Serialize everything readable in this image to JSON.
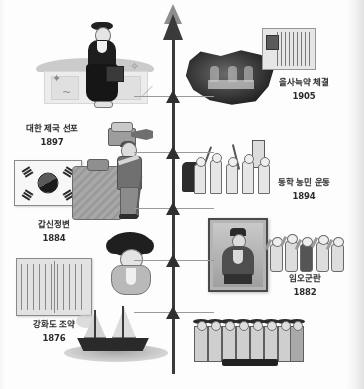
{
  "document": {
    "type": "korean-history-timeline-infographic",
    "orientation": "vertical-ascending-arrow",
    "colors": {
      "ink": "#2b2b2b",
      "timeline": "#3a3a3a",
      "page": "#fdfdfd"
    }
  },
  "timeline": {
    "name": "history-timeline-arrow",
    "direction": "upward",
    "nodes": [
      {
        "index": 0,
        "top_pct": 93
      },
      {
        "index": 1,
        "top_pct": 79
      },
      {
        "index": 2,
        "top_pct": 64
      },
      {
        "index": 3,
        "top_pct": 49
      },
      {
        "index": 4,
        "top_pct": 34
      },
      {
        "index": 5,
        "top_pct": 19
      }
    ]
  },
  "events": [
    {
      "id": "ganghwa-treaty",
      "title": "강화도 조약",
      "year": "1876",
      "side": "left",
      "label_top": 318,
      "label_left": 6,
      "label_width": 96,
      "art": "open-treaty-book, warships"
    },
    {
      "id": "imo-incident",
      "title": "임오군란",
      "year": "1882",
      "side": "right",
      "label_top": 272,
      "label_left": 262,
      "label_width": 86,
      "art": "framed-portrait, cheering-crowd"
    },
    {
      "id": "gapsin-coup",
      "title": "갑신정변",
      "year": "1884",
      "side": "left",
      "label_top": 218,
      "label_left": 6,
      "label_width": 96,
      "art": "taegukgi-flag, figure-in-hanbok"
    },
    {
      "id": "donghak-peasant-revolution",
      "title": "동학 농민 운동",
      "year": "1894",
      "side": "right",
      "label_top": 176,
      "label_left": 256,
      "label_width": 96,
      "art": "marching-peasants-with-banner"
    },
    {
      "id": "korean-empire-proclamation",
      "title": "대한 제국 선포",
      "year": "1897",
      "side": "left",
      "label_top": 122,
      "label_left": 2,
      "label_width": 100,
      "art": "hanok-house, woman-in-hanbok, phonograph, emperor-gojong"
    },
    {
      "id": "eulsa-treaty",
      "title": "을사늑약 체결",
      "year": "1905",
      "side": "right",
      "label_top": 76,
      "label_left": 256,
      "label_width": 96,
      "art": "torn-photograph, historical-document-with-seal"
    }
  ]
}
